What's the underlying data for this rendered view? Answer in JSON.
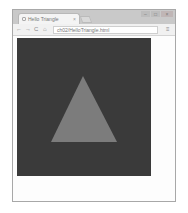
{
  "window": {
    "tab": {
      "title": "Hello Triangle",
      "close_glyph": "×"
    },
    "controls": {
      "minimize": "–",
      "maximize": "□",
      "close": "×"
    }
  },
  "toolbar": {
    "back_glyph": "←",
    "forward_glyph": "→",
    "reload_glyph": "C",
    "home_glyph": "⌂",
    "url": "ch02/HelloTriangle.html",
    "menu_glyph": "≡"
  },
  "canvas": {
    "background": "#3a3a3a",
    "shape": "triangle",
    "fill": "#7c7c7c",
    "points": [
      [
        66,
        38
      ],
      [
        34,
        104
      ],
      [
        100,
        104
      ]
    ]
  }
}
